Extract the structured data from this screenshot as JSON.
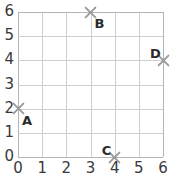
{
  "chart_data": {
    "type": "scatter",
    "title": "",
    "xlabel": "",
    "ylabel": "",
    "xlim": [
      0,
      6
    ],
    "ylim": [
      0,
      6
    ],
    "grid": true,
    "legend": "none",
    "x_ticks": [
      "0",
      "1",
      "2",
      "3",
      "4",
      "5",
      "6"
    ],
    "y_ticks": [
      "0",
      "1",
      "2",
      "3",
      "4",
      "5",
      "6"
    ],
    "marker_style": "x",
    "marker_color": "#9a9a9a",
    "label_color": "#2b2b2b",
    "gridline_color": "#cfcfcf",
    "points": [
      {
        "label": "A",
        "x": 0,
        "y": 2,
        "label_pos": "below-right"
      },
      {
        "label": "B",
        "x": 3,
        "y": 6,
        "label_pos": "below-right"
      },
      {
        "label": "C",
        "x": 4,
        "y": 0,
        "label_pos": "above-left"
      },
      {
        "label": "D",
        "x": 6,
        "y": 4,
        "label_pos": "above-left"
      }
    ]
  }
}
